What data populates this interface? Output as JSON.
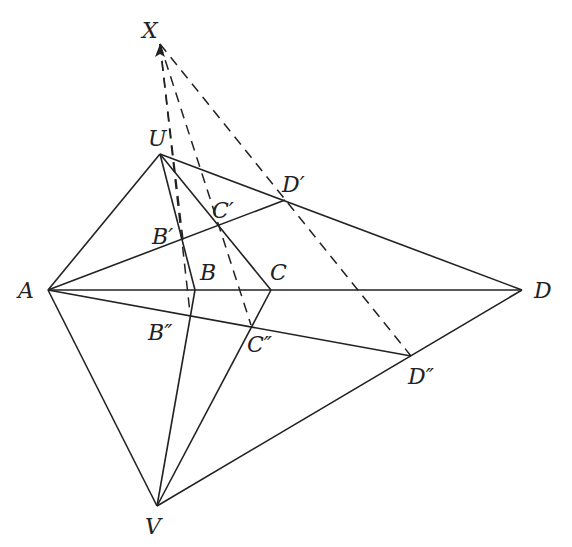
{
  "diagram": {
    "title": "",
    "points": {
      "X": {
        "label": "X",
        "x": 160,
        "y": 44,
        "lx": 142,
        "ly": 38
      },
      "U": {
        "label": "U",
        "x": 160,
        "y": 154,
        "lx": 148,
        "ly": 146
      },
      "A": {
        "label": "A",
        "x": 48,
        "y": 290,
        "lx": 18,
        "ly": 298
      },
      "B": {
        "label": "B",
        "x": 195,
        "y": 290,
        "lx": 200,
        "ly": 280
      },
      "C": {
        "label": "C",
        "x": 271,
        "y": 290,
        "lx": 270,
        "ly": 280
      },
      "D": {
        "label": "D",
        "x": 522,
        "y": 290,
        "lx": 534,
        "ly": 298
      },
      "V": {
        "label": "V",
        "x": 157,
        "y": 506,
        "lx": 145,
        "ly": 534
      },
      "B1": {
        "label": "B′",
        "x": 183,
        "y": 240,
        "lx": 152,
        "ly": 244
      },
      "C1": {
        "label": "C′",
        "x": 218,
        "y": 226,
        "lx": 212,
        "ly": 218
      },
      "D1": {
        "label": "D′",
        "x": 285,
        "y": 200,
        "lx": 282,
        "ly": 192
      },
      "B2": {
        "label": "B″",
        "x": 190,
        "y": 313,
        "lx": 148,
        "ly": 340
      },
      "C2": {
        "label": "C″",
        "x": 251,
        "y": 325,
        "lx": 247,
        "ly": 352
      },
      "D2": {
        "label": "D″",
        "x": 411,
        "y": 356,
        "lx": 408,
        "ly": 384
      }
    },
    "solid_segments": [
      [
        "A",
        "U"
      ],
      [
        "A",
        "V"
      ],
      [
        "A",
        "D"
      ],
      [
        "U",
        "B"
      ],
      [
        "U",
        "C"
      ],
      [
        "U",
        "D"
      ],
      [
        "V",
        "B"
      ],
      [
        "V",
        "C"
      ],
      [
        "V",
        "D"
      ],
      [
        "A",
        "D1"
      ],
      [
        "A",
        "D2"
      ]
    ],
    "dashed_segments": [
      [
        "X",
        "B2"
      ],
      [
        "X",
        "C2"
      ],
      [
        "X",
        "D2"
      ],
      [
        "X",
        "B1"
      ]
    ]
  }
}
